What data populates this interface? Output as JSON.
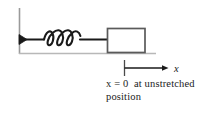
{
  "figure": {
    "name": "spring-mass-unstretched-position-diagram",
    "type": "physics-diagram",
    "background_color": "#ffffff"
  },
  "elements": {
    "wall": {
      "label": "wall",
      "color": "#9a9a9a",
      "x": 19,
      "y_top": 8,
      "y_bottom": 54
    },
    "anchor": {
      "label": "wall-anchor",
      "color": "#1a1a1a"
    },
    "spring": {
      "label": "spring",
      "coil_count": 3,
      "color": "#1a1a1a"
    },
    "block": {
      "label": "block",
      "fill": "#ffffff",
      "stroke": "#555555",
      "x": 107,
      "y": 28,
      "width": 38,
      "height": 24
    },
    "ground": {
      "label": "ground-line",
      "color": "#b5b5b5",
      "y": 53,
      "x_start": 19,
      "x_end": 156
    },
    "tick": {
      "label": "origin-tick-mark",
      "color": "#4a4a4a",
      "x": 124,
      "y_top": 60,
      "y_bottom": 76
    },
    "axis_arrow": {
      "label": "x-axis-arrow",
      "color": "#1a1a1a",
      "x_start": 124,
      "x_end": 167,
      "y": 68
    }
  },
  "labels": {
    "axis_label": "x",
    "caption_line_1": "x = 0  at unstretched",
    "caption_line_2": "position",
    "caption_full": "x = 0 at unstretched position"
  }
}
